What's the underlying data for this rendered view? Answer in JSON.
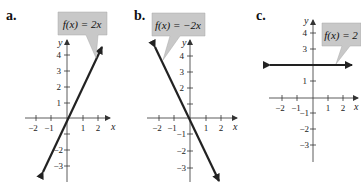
{
  "panels": [
    {
      "label": "a.",
      "function_label": "f(x) = 2x",
      "x_axis_label": "x",
      "y_axis_label": "y",
      "x_ticks": [
        "−2",
        "−1",
        "1",
        "2"
      ],
      "y_ticks": [
        "4",
        "3",
        "2",
        "1",
        "−2",
        "−3"
      ]
    },
    {
      "label": "b.",
      "function_label": "f(x) = −2x",
      "x_axis_label": "x",
      "y_axis_label": "y",
      "x_ticks": [
        "−2",
        "−1",
        "1",
        "2"
      ],
      "y_ticks": [
        "4",
        "3",
        "2",
        "−1",
        "−2",
        "−3"
      ]
    },
    {
      "label": "c.",
      "function_label": "f(x) = 2",
      "x_axis_label": "x",
      "y_axis_label": "y",
      "x_ticks": [
        "−2",
        "−1",
        "1",
        "2"
      ],
      "y_ticks": [
        "4",
        "3",
        "1",
        "−1",
        "−2",
        "−3"
      ]
    }
  ],
  "colors": {
    "line": "#222222",
    "callout_fill": "#c8c8c8",
    "axis": "#333333"
  }
}
